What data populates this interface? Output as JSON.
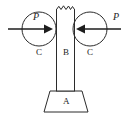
{
  "figure": {
    "type": "mechanics-free-body-diagram",
    "background_color": "#ffffff",
    "line_color": "#2b2b2b",
    "labels": {
      "base": "A",
      "column": "B",
      "roller_left": "C",
      "roller_right": "C",
      "force_left": "P",
      "force_right": "P"
    },
    "elements": {
      "base": {
        "name": "A",
        "shape": "trapezoid",
        "top_left_x": 50,
        "top_right_x": 82,
        "bottom_left_x": 44,
        "bottom_right_x": 88,
        "top_y": 91,
        "bottom_y": 112
      },
      "column": {
        "name": "B",
        "shape": "tapered-vertical-bar",
        "top_y": 8,
        "bottom_y": 91,
        "top_left_x": 56,
        "top_right_x": 75,
        "bottom_left_x": 57,
        "bottom_right_x": 74,
        "top_edge": "jagged-break"
      },
      "roller_left": {
        "name": "C",
        "shape": "circle",
        "cx": 39,
        "cy": 29,
        "r": 17
      },
      "roller_right": {
        "name": "C",
        "shape": "circle",
        "cx": 90,
        "cy": 29,
        "r": 17
      },
      "force_left": {
        "name": "P",
        "direction": "right",
        "from_x": 8,
        "to_x": 53,
        "y": 29
      },
      "force_right": {
        "name": "P",
        "direction": "left",
        "from_x": 121,
        "to_x": 76,
        "y": 29
      }
    }
  }
}
